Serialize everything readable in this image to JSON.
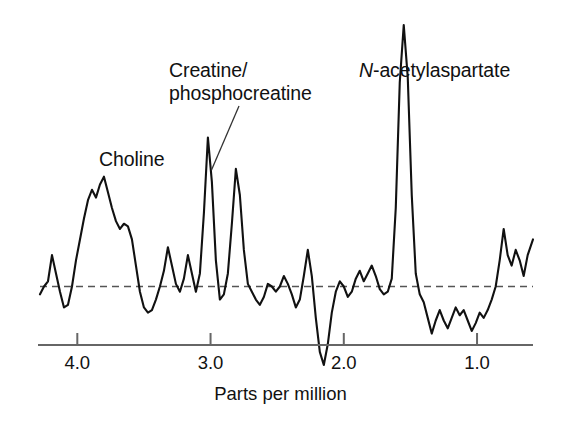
{
  "figure": {
    "background_color": "#ffffff",
    "trace_color": "#111111",
    "axis_color": "#666666",
    "baseline_color": "#555555"
  },
  "annotations": [
    {
      "name": "choline",
      "text": "Choline"
    },
    {
      "name": "creatine-line1",
      "text": "Creatine/"
    },
    {
      "name": "creatine-line2",
      "text": "phosphocreatine"
    },
    {
      "name": "naa-italic",
      "text": "N"
    },
    {
      "name": "naa-rest",
      "text": "-acetylaspartate"
    }
  ],
  "axis": {
    "title": "Parts per million",
    "tick_labels": [
      "4.0",
      "3.0",
      "2.0",
      "1.0"
    ],
    "tick_values": [
      4.0,
      3.0,
      2.0,
      1.0
    ]
  },
  "chart_data": {
    "type": "line",
    "title": "",
    "subtitle": "",
    "xlabel": "Parts per million",
    "ylabel": "",
    "xlim": [
      4.28,
      0.58
    ],
    "ylim": [
      -0.35,
      1.05
    ],
    "x_axis_inverted": true,
    "grid": false,
    "legend": null,
    "baseline": {
      "value": 0,
      "style": "dashed",
      "label": ""
    },
    "peaks": [
      {
        "label": "Choline",
        "ppm": 3.2,
        "relative_height": 0.57
      },
      {
        "label": "Creatine/phosphocreatine",
        "ppm": 3.0,
        "relative_height": 0.45
      },
      {
        "label": "N-acetylaspartate",
        "ppm": 2.02,
        "relative_height": 1.0
      }
    ],
    "series": [
      {
        "name": "Proton MR spectrum",
        "x": [
          4.28,
          4.25,
          4.22,
          4.19,
          4.16,
          4.13,
          4.1,
          4.07,
          4.04,
          4.01,
          3.98,
          3.95,
          3.92,
          3.89,
          3.86,
          3.83,
          3.8,
          3.77,
          3.74,
          3.71,
          3.68,
          3.65,
          3.62,
          3.59,
          3.56,
          3.53,
          3.5,
          3.47,
          3.44,
          3.41,
          3.38,
          3.35,
          3.32,
          3.29,
          3.26,
          3.23,
          3.2,
          3.17,
          3.14,
          3.11,
          3.08,
          3.05,
          3.02,
          2.99,
          2.96,
          2.93,
          2.9,
          2.87,
          2.84,
          2.81,
          2.78,
          2.75,
          2.72,
          2.69,
          2.66,
          2.63,
          2.6,
          2.57,
          2.54,
          2.51,
          2.48,
          2.45,
          2.42,
          2.39,
          2.36,
          2.33,
          2.3,
          2.27,
          2.24,
          2.21,
          2.18,
          2.15,
          2.12,
          2.09,
          2.06,
          2.03,
          2.0,
          1.97,
          1.94,
          1.91,
          1.88,
          1.85,
          1.82,
          1.79,
          1.76,
          1.73,
          1.7,
          1.67,
          1.64,
          1.61,
          1.58,
          1.55,
          1.52,
          1.49,
          1.46,
          1.43,
          1.4,
          1.37,
          1.34,
          1.31,
          1.28,
          1.25,
          1.22,
          1.19,
          1.16,
          1.13,
          1.1,
          1.07,
          1.04,
          1.01,
          0.98,
          0.95,
          0.92,
          0.89,
          0.86,
          0.83,
          0.8,
          0.77,
          0.74,
          0.71,
          0.68,
          0.65,
          0.62,
          0.58
        ],
        "y": [
          -0.03,
          0.0,
          0.02,
          0.12,
          0.05,
          -0.02,
          -0.08,
          -0.07,
          0.0,
          0.1,
          0.18,
          0.26,
          0.33,
          0.37,
          0.34,
          0.39,
          0.42,
          0.36,
          0.3,
          0.25,
          0.22,
          0.24,
          0.23,
          0.18,
          0.08,
          -0.02,
          -0.08,
          -0.1,
          -0.09,
          -0.05,
          0.0,
          0.06,
          0.15,
          0.08,
          0.01,
          -0.02,
          0.03,
          0.12,
          0.05,
          -0.02,
          0.05,
          0.28,
          0.57,
          0.4,
          0.1,
          -0.05,
          -0.03,
          0.05,
          0.24,
          0.45,
          0.35,
          0.14,
          0.01,
          -0.02,
          -0.05,
          -0.07,
          -0.04,
          0.01,
          0.0,
          -0.02,
          0.0,
          0.04,
          0.01,
          -0.03,
          -0.08,
          -0.05,
          0.04,
          0.14,
          0.04,
          -0.12,
          -0.25,
          -0.3,
          -0.22,
          -0.1,
          -0.02,
          0.02,
          0.0,
          -0.04,
          -0.02,
          0.03,
          0.06,
          0.02,
          0.05,
          0.08,
          0.04,
          -0.01,
          -0.03,
          -0.02,
          0.03,
          0.3,
          0.78,
          1.0,
          0.8,
          0.35,
          0.05,
          -0.03,
          -0.06,
          -0.12,
          -0.18,
          -0.13,
          -0.09,
          -0.13,
          -0.16,
          -0.12,
          -0.08,
          -0.11,
          -0.09,
          -0.13,
          -0.17,
          -0.14,
          -0.1,
          -0.12,
          -0.09,
          -0.05,
          0.0,
          0.1,
          0.22,
          0.12,
          0.08,
          0.14,
          0.1,
          0.04,
          0.12,
          0.18
        ]
      }
    ]
  }
}
